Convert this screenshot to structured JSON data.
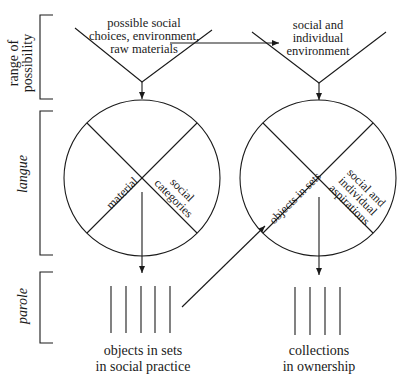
{
  "side_labels": {
    "range_line1": "range of",
    "range_line2": "possibility",
    "langue": "langue",
    "parole": "parole"
  },
  "top": {
    "left_line1": "possible social",
    "left_line2": "choices, environment,",
    "left_line3": "raw materials",
    "right_line1": "social and",
    "right_line2": "individual",
    "right_line3": "environment"
  },
  "left_circle": {
    "material": "material",
    "social_line1": "social",
    "social_line2": "categories"
  },
  "right_circle": {
    "objects": "objects in sets",
    "asp_line1": "social and",
    "asp_line2": "individual",
    "asp_line3": "aspirations"
  },
  "bottom": {
    "left_line1": "objects in sets",
    "left_line2": "in social practice",
    "right_line1": "collections",
    "right_line2": "in ownership"
  },
  "colors": {
    "stroke": "#1a1a1a",
    "background": "#ffffff"
  }
}
